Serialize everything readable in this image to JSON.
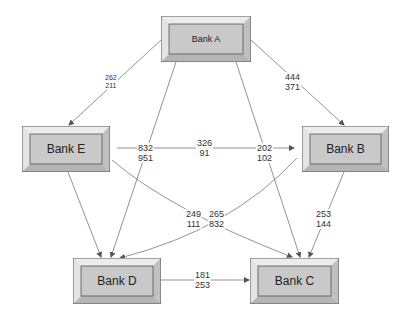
{
  "colors": {
    "box_fill": "#c9c9c9",
    "box_outer": "#dcdcdc",
    "box_border": "#555555",
    "edge": "#777777"
  },
  "nodes": {
    "bank_a": {
      "label": "Bank A"
    },
    "bank_b": {
      "label": "Bank B"
    },
    "bank_c": {
      "label": "Bank C"
    },
    "bank_d": {
      "label": "Bank D"
    },
    "bank_e": {
      "label": "Bank E"
    }
  },
  "edges": {
    "a_to_e": {
      "from": "Bank A",
      "to": "Bank E",
      "top": "262",
      "bottom": "211"
    },
    "a_to_b": {
      "from": "Bank A",
      "to": "Bank B",
      "top": "444",
      "bottom": "371"
    },
    "a_to_d": {
      "from": "Bank A",
      "to": "Bank D",
      "top": "832",
      "bottom": "951"
    },
    "a_to_c": {
      "from": "Bank A",
      "to": "Bank C",
      "top": "202",
      "bottom": "102"
    },
    "e_to_b": {
      "from": "Bank E",
      "to": "Bank B",
      "top": "326",
      "bottom": "91"
    },
    "e_to_c": {
      "from": "Bank E",
      "to": "Bank C",
      "top": "249",
      "bottom": "111"
    },
    "b_to_d": {
      "from": "Bank B",
      "to": "Bank D",
      "top": "265",
      "bottom": "832"
    },
    "b_to_c": {
      "from": "Bank B",
      "to": "Bank C",
      "top": "253",
      "bottom": "144"
    },
    "d_to_c": {
      "from": "Bank D",
      "to": "Bank C",
      "top": "181",
      "bottom": "253"
    }
  }
}
